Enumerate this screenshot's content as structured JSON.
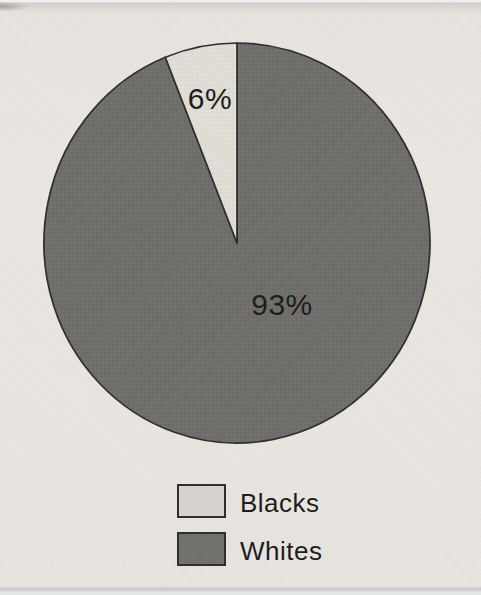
{
  "page": {
    "background_color": "#e8e5e0",
    "ink_color": "#1c1b19"
  },
  "chart_data": {
    "type": "pie",
    "title": "",
    "categories": [
      "Whites",
      "Blacks"
    ],
    "values": [
      93,
      6
    ],
    "slices": [
      {
        "label": "Whites",
        "value": 93,
        "display_label": "93%",
        "color": "#6e6d6a"
      },
      {
        "label": "Blacks",
        "value": 6,
        "display_label": "6%",
        "color": "#e0ded6"
      }
    ],
    "start_angle_deg": 0,
    "direction": "clockwise",
    "outline_color": "#2e2d2a",
    "legend_position": "bottom-center",
    "legend": [
      {
        "label": "Blacks",
        "color": "#d6d4cd"
      },
      {
        "label": "Whites",
        "color": "#71706d"
      }
    ]
  }
}
